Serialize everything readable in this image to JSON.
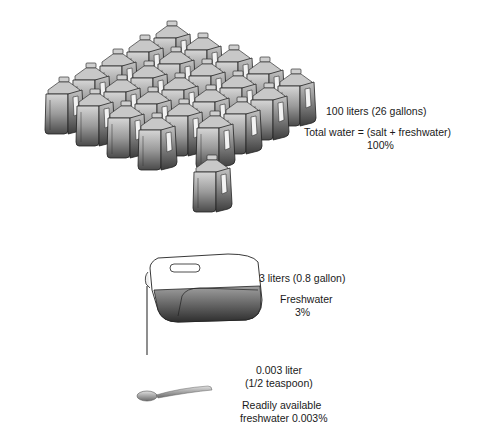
{
  "total": {
    "amount": "100 liters (26 gallons)",
    "description": "Total water = (salt + freshwater)",
    "percent": "100%",
    "jug_grid": {
      "rows": 5,
      "cols": 5,
      "extra": 1
    }
  },
  "freshwater": {
    "amount": "3 liters (0.8 gallon)",
    "description": "Freshwater",
    "percent": "3%"
  },
  "available": {
    "amount": "0.003 liter",
    "measure": "(1/2 teaspoon)",
    "description_line1": "Readily available",
    "description_line2": "freshwater 0.003%"
  },
  "icons": [
    "water-jug-icon",
    "pouring-jug-icon",
    "teaspoon-icon"
  ]
}
